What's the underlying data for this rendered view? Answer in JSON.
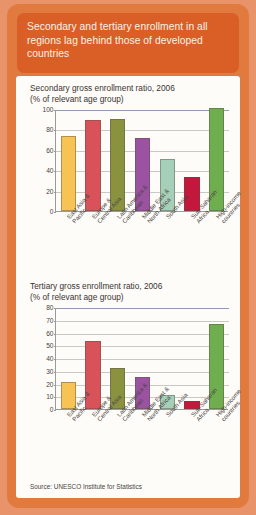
{
  "header": {
    "title": "Secondary and tertiary enrollment in all regions lag behind those of developed countries",
    "bg_color": "#d95f27",
    "frame_color": "#e07a3f"
  },
  "source": {
    "text": "Source: UNESCO Institute for Statistics"
  },
  "palette": {
    "east_asia": "#f5c council",
    "colors": [
      "#f7c355",
      "#d9525a",
      "#8a9240",
      "#9b52a0",
      "#a6cfb8",
      "#c4173c",
      "#6fae4e"
    ]
  },
  "chart_data": [
    {
      "type": "bar",
      "title": "Secondary gross enrollment ratio, 2006",
      "subtitle": "(% of relevant age group)",
      "xlabel": "",
      "ylabel": "",
      "ylim": [
        0,
        100
      ],
      "yticks": [
        0,
        20,
        40,
        60,
        80,
        100
      ],
      "grid": true,
      "legend": "none",
      "categories": [
        "East Asia & Pacific",
        "Europe & Central Asia",
        "Latin America & Caribbean",
        "Middle East & North Africa",
        "South Asia",
        "Sub-Saharan Africa",
        "High-income countries"
      ],
      "category_lines": [
        [
          "East Asia &",
          "Pacific"
        ],
        [
          "Europe &",
          "Central Asia"
        ],
        [
          "Latin America &",
          "Caribbean"
        ],
        [
          "Middle East &",
          "North Africa"
        ],
        [
          "South Asia"
        ],
        [
          "Sub-Saharan",
          "Africa"
        ],
        [
          "High-income",
          "countries"
        ]
      ],
      "values": [
        74,
        89,
        90,
        72,
        51,
        33,
        101
      ],
      "colors": [
        "#f7c355",
        "#d9525a",
        "#8a9240",
        "#9b52a0",
        "#a6cfb8",
        "#c4173c",
        "#6fae4e"
      ]
    },
    {
      "type": "bar",
      "title": "Tertiary gross enrollment ratio, 2006",
      "subtitle": "(% of relevant age group)",
      "xlabel": "",
      "ylabel": "",
      "ylim": [
        0,
        80
      ],
      "yticks": [
        0,
        10,
        20,
        30,
        40,
        50,
        60,
        70,
        80
      ],
      "grid": true,
      "legend": "none",
      "categories": [
        "East Asia & Pacific",
        "Europe & Central Asia",
        "Latin America & Caribbean",
        "Middle East & North Africa",
        "South Asia",
        "Sub-Saharan Africa",
        "High-income countries"
      ],
      "category_lines": [
        [
          "East Asia &",
          "Pacific"
        ],
        [
          "Europe &",
          "Central Asia"
        ],
        [
          "Latin America &",
          "Caribbean"
        ],
        [
          "Middle East &",
          "North Africa"
        ],
        [
          "South Asia"
        ],
        [
          "Sub-Saharan",
          "Africa"
        ],
        [
          "High-income",
          "countries"
        ]
      ],
      "values": [
        21,
        53,
        32,
        25,
        11,
        6,
        67
      ],
      "colors": [
        "#f7c355",
        "#d9525a",
        "#8a9240",
        "#9b52a0",
        "#a6cfb8",
        "#c4173c",
        "#6fae4e"
      ]
    }
  ]
}
